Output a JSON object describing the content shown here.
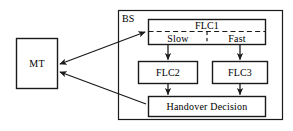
{
  "diagram": {
    "type": "block-diagram",
    "background_color": "#ffffff",
    "line_color": "#1a1a1a",
    "text_color": "#000000",
    "nodes": {
      "bs": {
        "label": "BS",
        "description": "Base Station container",
        "shape": "rectangle",
        "border": "solid"
      },
      "mt": {
        "label": "MT",
        "description": "Mobile Terminal",
        "shape": "rectangle",
        "border": "solid"
      },
      "flc1": {
        "label": "FLC1",
        "description": "Fuzzy Logic Controller 1",
        "shape": "rectangle",
        "border": "solid",
        "compartments": [
          {
            "label": "Slow",
            "divider": "dashed"
          },
          {
            "label": "Fast",
            "divider": "dashed"
          }
        ]
      },
      "flc2": {
        "label": "FLC2",
        "description": "Fuzzy Logic Controller 2",
        "shape": "rectangle",
        "border": "solid"
      },
      "flc3": {
        "label": "FLC3",
        "description": "Fuzzy Logic Controller 3",
        "shape": "rectangle",
        "border": "solid"
      },
      "handover": {
        "label": "Handover Decision",
        "description": "Final handover decision block",
        "shape": "rectangle",
        "border": "solid"
      }
    },
    "edges": [
      {
        "from": "mt",
        "to": "flc1",
        "style": "solid",
        "arrows": "both"
      },
      {
        "from": "flc1_slow",
        "to": "flc2",
        "style": "solid",
        "arrows": "end"
      },
      {
        "from": "flc1_fast",
        "to": "flc3",
        "style": "solid",
        "arrows": "end"
      },
      {
        "from": "flc2",
        "to": "handover",
        "style": "solid",
        "arrows": "end"
      },
      {
        "from": "flc3",
        "to": "handover",
        "style": "solid",
        "arrows": "end"
      },
      {
        "from": "handover",
        "to": "mt",
        "style": "solid",
        "arrows": "end"
      }
    ]
  }
}
